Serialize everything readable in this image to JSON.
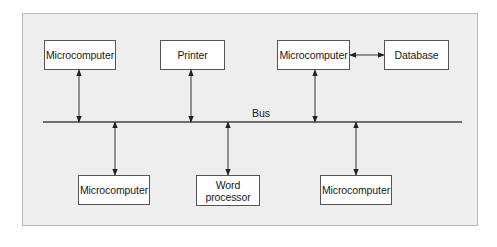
{
  "diagram": {
    "type": "bus-network",
    "bus": {
      "label": "Bus",
      "y": 122,
      "x_start": 43,
      "x_end": 462
    },
    "colors": {
      "panel_background": "#eeeeee",
      "panel_border": "#b8b8b8",
      "node_background": "#ffffff",
      "node_border": "#555555",
      "line": "#333333"
    },
    "nodes": [
      {
        "id": "top-microcomputer-1",
        "label": "Microcomputer",
        "x": 44,
        "y": 40,
        "w": 72,
        "h": 30,
        "connects_to": "bus"
      },
      {
        "id": "top-printer",
        "label": "Printer",
        "x": 160,
        "y": 40,
        "w": 65,
        "h": 30,
        "connects_to": "bus"
      },
      {
        "id": "top-microcomputer-2",
        "label": "Microcomputer",
        "x": 277,
        "y": 40,
        "w": 73,
        "h": 30,
        "connects_to": "bus"
      },
      {
        "id": "top-database",
        "label": "Database",
        "x": 384,
        "y": 40,
        "w": 65,
        "h": 30,
        "connects_to": "top-microcomputer-2"
      },
      {
        "id": "bottom-microcomputer-1",
        "label": "Microcomputer",
        "x": 78,
        "y": 175,
        "w": 72,
        "h": 30,
        "connects_to": "bus"
      },
      {
        "id": "bottom-word-processor",
        "label": "Word\nprocessor",
        "x": 196,
        "y": 175,
        "w": 64,
        "h": 31,
        "connects_to": "bus"
      },
      {
        "id": "bottom-microcomputer-2",
        "label": "Microcomputer",
        "x": 320,
        "y": 175,
        "w": 72,
        "h": 30,
        "connects_to": "bus"
      }
    ],
    "connections": [
      {
        "from": "top-microcomputer-1",
        "to": "bus",
        "x": 79,
        "y1": 70,
        "y2": 122,
        "arrows": "both"
      },
      {
        "from": "top-printer",
        "to": "bus",
        "x": 191,
        "y1": 70,
        "y2": 122,
        "arrows": "both"
      },
      {
        "from": "top-microcomputer-2",
        "to": "bus",
        "x": 315,
        "y1": 70,
        "y2": 122,
        "arrows": "both"
      },
      {
        "from": "top-microcomputer-2",
        "to": "top-database",
        "y": 55,
        "x1": 350,
        "x2": 384,
        "arrows": "both"
      },
      {
        "from": "bus",
        "to": "bottom-microcomputer-1",
        "x": 115,
        "y1": 122,
        "y2": 175,
        "arrows": "both"
      },
      {
        "from": "bus",
        "to": "bottom-word-processor",
        "x": 228,
        "y1": 122,
        "y2": 175,
        "arrows": "both"
      },
      {
        "from": "bus",
        "to": "bottom-microcomputer-2",
        "x": 356,
        "y1": 122,
        "y2": 175,
        "arrows": "both"
      }
    ]
  }
}
